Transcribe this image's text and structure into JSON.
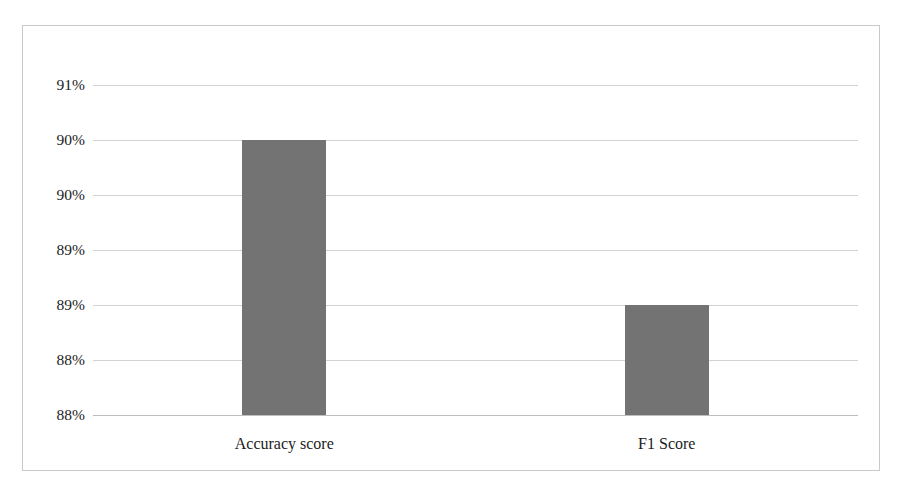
{
  "chart_data": {
    "type": "bar",
    "title": "",
    "subtitle": "",
    "xlabel": "",
    "ylabel": "",
    "categories": [
      "Accuracy score",
      "F1 Score"
    ],
    "values": [
      90.0,
      88.5
    ],
    "value_labels": [
      "90%",
      "89%"
    ],
    "ylim": [
      87.5,
      90.5
    ],
    "y_tick_values": [
      90.5,
      90.0,
      89.5,
      89.0,
      88.5,
      88.0,
      87.5
    ],
    "y_tick_labels": [
      "91%",
      "90%",
      "90%",
      "89%",
      "89%",
      "88%",
      "88%"
    ],
    "grid": true,
    "grid_axis": "y",
    "legend": false,
    "legend_position": "none",
    "series": [
      {
        "name": "Score",
        "values": [
          90.0,
          88.5
        ],
        "color": "#737373"
      }
    ],
    "annotations": [],
    "colors": {
      "bar_fill": "#737373",
      "gridline": "#d2d2d2",
      "axis_line": "#bdbdbd",
      "frame_border": "#c9c9c9",
      "plot_background": "#ffffff",
      "text": "#1c1c1c"
    }
  },
  "figure": {
    "background": "#ffffff",
    "border_color": "#c9c9c9"
  }
}
